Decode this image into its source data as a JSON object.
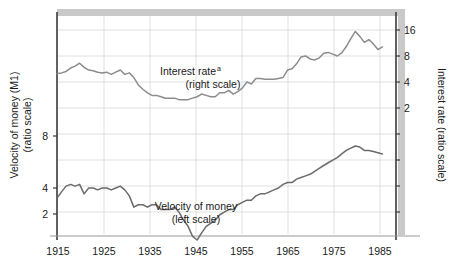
{
  "chart_data": {
    "type": "line",
    "title": "",
    "xlabel": "",
    "grid": true,
    "legend_position": "inline-annotations",
    "x_ticks": [
      "1915",
      "1925",
      "1935",
      "1945",
      "1955",
      "1965",
      "1975",
      "1985"
    ],
    "x_tick_values": [
      1915,
      1925,
      1935,
      1945,
      1955,
      1965,
      1975,
      1985
    ],
    "xlim": [
      1915,
      1990
    ],
    "left_axis": {
      "label_line1": "Velocity of money (M1)",
      "label_line2": "(ratio scale)",
      "ticks": [
        "8",
        "4",
        "2"
      ],
      "tick_values": [
        8,
        4,
        2
      ],
      "scale": "log",
      "ylim": [
        1.6,
        40
      ]
    },
    "right_axis": {
      "label": "Interest rate (ratio scale)",
      "ticks": [
        "16",
        "8",
        "4",
        "2"
      ],
      "tick_values": [
        16,
        8,
        4,
        2
      ],
      "scale": "log",
      "ylim": [
        0.55,
        22
      ]
    },
    "series": [
      {
        "name": "Interest rate",
        "annotation_line1": "Interest rate",
        "annotation_superscript": "a",
        "annotation_line2": "(right scale)",
        "axis": "right",
        "color": "#8c8c8c",
        "x": [
          1915,
          1916,
          1917,
          1918,
          1919,
          1920,
          1921,
          1922,
          1923,
          1924,
          1925,
          1926,
          1927,
          1928,
          1929,
          1930,
          1931,
          1932,
          1933,
          1934,
          1935,
          1936,
          1937,
          1938,
          1939,
          1940,
          1941,
          1942,
          1943,
          1944,
          1945,
          1946,
          1947,
          1948,
          1949,
          1950,
          1951,
          1952,
          1953,
          1954,
          1955,
          1956,
          1957,
          1958,
          1959,
          1960,
          1961,
          1962,
          1963,
          1964,
          1965,
          1966,
          1967,
          1968,
          1969,
          1970,
          1971,
          1972,
          1973,
          1974,
          1975,
          1976,
          1977,
          1978,
          1979,
          1980,
          1981,
          1982,
          1983,
          1984,
          1985,
          1986,
          1987
        ],
        "values": [
          5.0,
          5.1,
          5.3,
          5.8,
          6.1,
          6.6,
          5.9,
          5.5,
          5.4,
          5.2,
          5.1,
          5.2,
          4.9,
          5.2,
          5.5,
          4.9,
          5.1,
          4.5,
          3.7,
          3.3,
          3.0,
          2.8,
          2.8,
          2.7,
          2.6,
          2.6,
          2.6,
          2.5,
          2.5,
          2.5,
          2.6,
          2.7,
          2.9,
          2.8,
          2.7,
          2.7,
          3.0,
          3.0,
          3.2,
          2.9,
          3.1,
          3.4,
          4.0,
          3.8,
          4.4,
          4.4,
          4.3,
          4.3,
          4.3,
          4.4,
          4.5,
          5.5,
          5.7,
          6.5,
          7.8,
          8.0,
          7.4,
          7.2,
          7.6,
          8.6,
          8.8,
          8.4,
          8.0,
          8.7,
          10.3,
          12.7,
          15.4,
          13.5,
          11.5,
          12.4,
          11.0,
          9.5,
          10.2
        ]
      },
      {
        "name": "Velocity of money",
        "annotation_line1": "Velocity of money",
        "annotation_line2": "(left scale)",
        "axis": "left",
        "color": "#6b6b6b",
        "x": [
          1915,
          1916,
          1917,
          1918,
          1919,
          1920,
          1921,
          1922,
          1923,
          1924,
          1925,
          1926,
          1927,
          1928,
          1929,
          1930,
          1931,
          1932,
          1933,
          1934,
          1935,
          1936,
          1937,
          1938,
          1939,
          1940,
          1941,
          1942,
          1943,
          1944,
          1945,
          1946,
          1947,
          1948,
          1949,
          1950,
          1951,
          1952,
          1953,
          1954,
          1955,
          1956,
          1957,
          1958,
          1959,
          1960,
          1961,
          1962,
          1963,
          1964,
          1965,
          1966,
          1967,
          1968,
          1969,
          1970,
          1971,
          1972,
          1973,
          1974,
          1975,
          1976,
          1977,
          1978,
          1979,
          1980,
          1981,
          1982,
          1983,
          1984,
          1985,
          1986,
          1987
        ],
        "values": [
          3.5,
          3.8,
          4.1,
          4.2,
          4.1,
          4.2,
          3.7,
          4.0,
          4.0,
          3.9,
          4.0,
          4.0,
          3.9,
          4.0,
          4.1,
          3.9,
          3.6,
          3.1,
          3.2,
          3.2,
          3.1,
          3.2,
          3.2,
          3.0,
          3.0,
          3.0,
          3.1,
          2.9,
          2.6,
          2.4,
          2.1,
          2.0,
          2.2,
          2.4,
          2.5,
          2.6,
          2.8,
          2.9,
          3.0,
          3.0,
          3.2,
          3.3,
          3.4,
          3.4,
          3.6,
          3.7,
          3.7,
          3.8,
          3.9,
          4.0,
          4.2,
          4.3,
          4.3,
          4.5,
          4.6,
          4.7,
          4.8,
          5.0,
          5.2,
          5.4,
          5.6,
          5.8,
          6.0,
          6.3,
          6.6,
          6.8,
          7.0,
          6.9,
          6.6,
          6.6,
          6.5,
          6.4,
          6.3
        ]
      }
    ]
  }
}
